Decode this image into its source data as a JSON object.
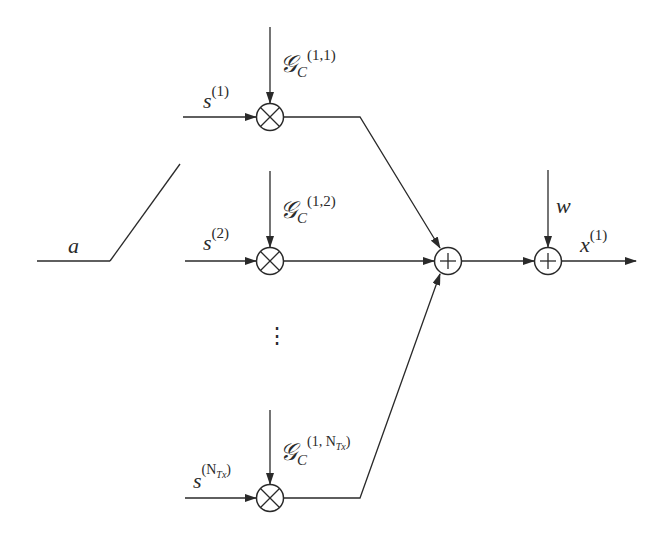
{
  "diagram": {
    "type": "signal-flow block diagram",
    "switch": {
      "label": "a"
    },
    "branches": [
      {
        "input": "s",
        "input_sup": "(1)",
        "gain": "𝒢",
        "gain_sub": "C",
        "gain_sup": "(1,1)"
      },
      {
        "input": "s",
        "input_sup": "(2)",
        "gain": "𝒢",
        "gain_sub": "C",
        "gain_sup": "(1,2)"
      },
      {
        "input": "s",
        "input_sup_base": "(N",
        "input_sup_sub": "Tx",
        "input_sup_end": ")",
        "gain": "𝒢",
        "gain_sub": "C",
        "gain_sup_base": "(1, N",
        "gain_sup_sub": "Tx",
        "gain_sup_end": ")"
      }
    ],
    "ellipsis": "⋮",
    "noise": {
      "label": "w"
    },
    "output": {
      "label": "x",
      "sup": "(1)"
    },
    "nodes": {
      "multiplier_symbol": "⊗",
      "adder_symbol": "⊕"
    },
    "stroke_color": "#2a2a2a"
  }
}
